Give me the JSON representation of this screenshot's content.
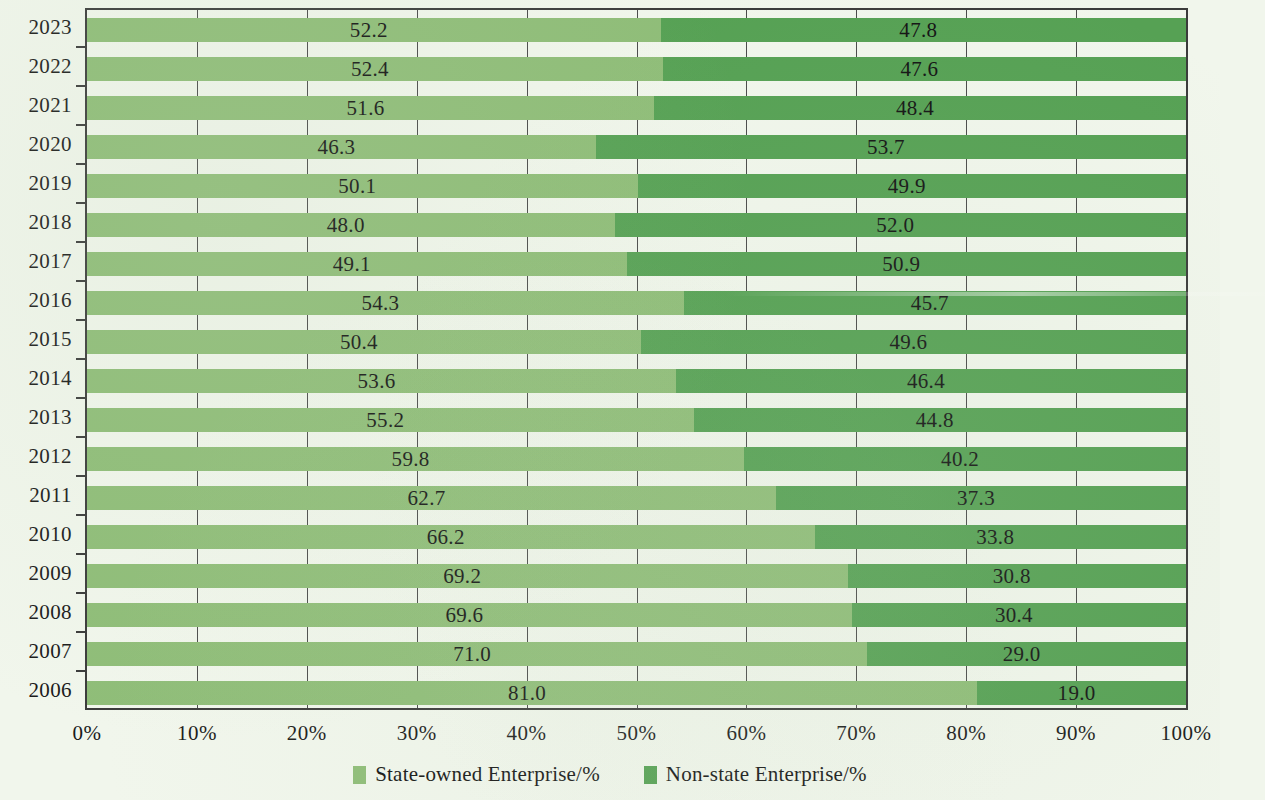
{
  "chart_data": {
    "type": "bar",
    "subtype": "stacked-horizontal-100percent",
    "title": "",
    "xlabel": "",
    "ylabel": "",
    "orientation": "horizontal",
    "stacked": true,
    "grid": true,
    "xlim": [
      0,
      100
    ],
    "legend_position": "bottom-center",
    "categories": [
      "2023",
      "2022",
      "2021",
      "2020",
      "2019",
      "2018",
      "2017",
      "2016",
      "2015",
      "2014",
      "2013",
      "2012",
      "2011",
      "2010",
      "2009",
      "2008",
      "2007",
      "2006"
    ],
    "xticks": [
      "0%",
      "10%",
      "20%",
      "30%",
      "40%",
      "50%",
      "60%",
      "70%",
      "80%",
      "90%",
      "100%"
    ],
    "xtick_values": [
      0,
      10,
      20,
      30,
      40,
      50,
      60,
      70,
      80,
      90,
      100
    ],
    "series": [
      {
        "name": "State-owned Enterprise/%",
        "color": "#8fbd78",
        "values": [
          52.2,
          52.4,
          51.6,
          46.3,
          50.1,
          48.0,
          49.1,
          54.3,
          50.4,
          53.6,
          55.2,
          59.8,
          62.7,
          66.2,
          69.2,
          69.6,
          71.0,
          81.0
        ],
        "labels": [
          "52.2",
          "52.4",
          "51.6",
          "46.3",
          "50.1",
          "48.0",
          "49.1",
          "54.3",
          "50.4",
          "53.6",
          "55.2",
          "59.8",
          "62.7",
          "66.2",
          "69.2",
          "69.6",
          "71.0",
          "81.0"
        ]
      },
      {
        "name": "Non-state Enterprise/%",
        "color": "#56a154",
        "values": [
          47.8,
          47.6,
          48.4,
          53.7,
          49.9,
          52.0,
          50.9,
          45.7,
          49.6,
          46.4,
          44.8,
          40.2,
          37.3,
          33.8,
          30.8,
          30.4,
          29.0,
          19.0
        ],
        "labels": [
          "47.8",
          "47.6",
          "48.4",
          "53.7",
          "49.9",
          "52.0",
          "50.9",
          "45.7",
          "49.6",
          "46.4",
          "44.8",
          "40.2",
          "37.3",
          "33.8",
          "30.8",
          "30.4",
          "29.0",
          "19.0"
        ]
      }
    ]
  },
  "legend": {
    "items": [
      {
        "label": "State-owned Enterprise/%",
        "color": "#8fbd78"
      },
      {
        "label": "Non-state Enterprise/%",
        "color": "#56a154"
      }
    ]
  },
  "colors": {
    "background": "#f1f6ec",
    "state_owned": "#8fbd78",
    "non_state": "#56a154",
    "axis": "#3b3b3b",
    "text": "#1b1b1b"
  }
}
